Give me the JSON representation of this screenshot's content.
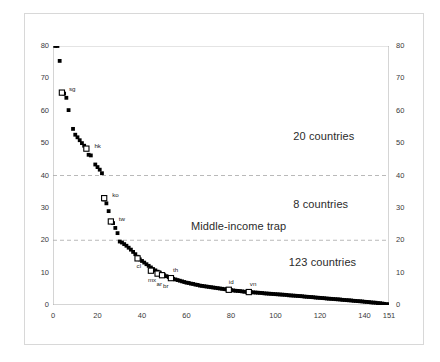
{
  "chart_data": {
    "type": "scatter",
    "title": "",
    "xlabel": "",
    "ylabel": "",
    "xlim": [
      0,
      151
    ],
    "ylim": [
      0,
      80
    ],
    "xticks": [
      0,
      20,
      40,
      60,
      80,
      100,
      120,
      140,
      151
    ],
    "yticks": [
      0,
      10,
      20,
      30,
      40,
      50,
      60,
      70,
      80
    ],
    "grid": "horizontal-dashed-at-20-and-40",
    "legend": "none",
    "left_axis_ticklabels": [
      "0",
      "10",
      "20",
      "30",
      "40",
      "50",
      "60",
      "70",
      "80"
    ],
    "right_axis_ticklabels": [
      "0",
      "10",
      "20",
      "30",
      "40",
      "50",
      "60",
      "70",
      "80"
    ],
    "x_axis_ticklabels": [
      "0",
      "20",
      "40",
      "60",
      "80",
      "100",
      "120",
      "140",
      "151"
    ],
    "annotations": [
      {
        "text": "20 countries",
        "x": 108,
        "y": 52
      },
      {
        "text": "8 countries",
        "x": 108,
        "y": 31
      },
      {
        "text": "Middle-income trap",
        "x": 62,
        "y": 24
      },
      {
        "text": "123 countries",
        "x": 106,
        "y": 13
      }
    ],
    "reference_lines": [
      {
        "y": 40,
        "style": "dashed",
        "color": "#b9b9b9"
      },
      {
        "y": 20,
        "style": "dashed",
        "color": "#b9b9b9"
      }
    ],
    "series": [
      {
        "name": "countries by income ratio (descending rank)",
        "marker": "filled-square",
        "points": [
          [
            1,
            80.0
          ],
          [
            2,
            80.0
          ],
          [
            3,
            75.4
          ],
          [
            5,
            65.3
          ],
          [
            6,
            64.0
          ],
          [
            7,
            60.2
          ],
          [
            9,
            54.4
          ],
          [
            10,
            52.6
          ],
          [
            11,
            51.8
          ],
          [
            12,
            50.9
          ],
          [
            13,
            50.0
          ],
          [
            14,
            49.2
          ],
          [
            16,
            46.4
          ],
          [
            17,
            46.2
          ],
          [
            19,
            43.4
          ],
          [
            20,
            42.6
          ],
          [
            21,
            41.8
          ],
          [
            22,
            40.7
          ],
          [
            23,
            32.6
          ],
          [
            24,
            31.4
          ],
          [
            25,
            29.0
          ],
          [
            27,
            25.3
          ],
          [
            28,
            23.8
          ],
          [
            29,
            22.2
          ],
          [
            30,
            19.6
          ],
          [
            31,
            19.3
          ],
          [
            32,
            18.8
          ],
          [
            33,
            18.3
          ],
          [
            34,
            17.7
          ],
          [
            35,
            17.1
          ],
          [
            36,
            16.4
          ],
          [
            37,
            15.7
          ],
          [
            38,
            14.9
          ],
          [
            39,
            14.1
          ],
          [
            40,
            13.6
          ],
          [
            41,
            13.1
          ],
          [
            42,
            12.6
          ],
          [
            43,
            12.1
          ],
          [
            44,
            11.6
          ],
          [
            45,
            11.1
          ],
          [
            46,
            10.7
          ],
          [
            47,
            10.3
          ],
          [
            48,
            10.0
          ],
          [
            49,
            9.6
          ],
          [
            50,
            9.2
          ],
          [
            51,
            8.9
          ],
          [
            52,
            8.6
          ],
          [
            53,
            8.3
          ],
          [
            54,
            8.1
          ],
          [
            55,
            7.9
          ],
          [
            56,
            7.7
          ],
          [
            57,
            7.5
          ],
          [
            58,
            7.3
          ],
          [
            59,
            7.1
          ],
          [
            60,
            6.9
          ],
          [
            61,
            6.8
          ],
          [
            62,
            6.6
          ],
          [
            63,
            6.5
          ],
          [
            64,
            6.3
          ],
          [
            65,
            6.2
          ],
          [
            66,
            6.0
          ],
          [
            67,
            5.9
          ],
          [
            68,
            5.8
          ],
          [
            69,
            5.7
          ],
          [
            70,
            5.6
          ],
          [
            71,
            5.5
          ],
          [
            72,
            5.4
          ],
          [
            73,
            5.3
          ],
          [
            74,
            5.2
          ],
          [
            75,
            5.1
          ],
          [
            76,
            5.0
          ],
          [
            77,
            4.9
          ],
          [
            78,
            4.8
          ],
          [
            79,
            4.7
          ],
          [
            80,
            4.6
          ],
          [
            81,
            4.5
          ],
          [
            82,
            4.4
          ],
          [
            83,
            4.35
          ],
          [
            84,
            4.3
          ],
          [
            85,
            4.2
          ],
          [
            86,
            4.1
          ],
          [
            87,
            4.05
          ],
          [
            88,
            4.0
          ],
          [
            89,
            3.95
          ],
          [
            90,
            3.9
          ],
          [
            91,
            3.85
          ],
          [
            92,
            3.8
          ],
          [
            93,
            3.75
          ],
          [
            94,
            3.7
          ],
          [
            95,
            3.6
          ],
          [
            96,
            3.55
          ],
          [
            97,
            3.5
          ],
          [
            98,
            3.45
          ],
          [
            99,
            3.4
          ],
          [
            100,
            3.35
          ],
          [
            101,
            3.3
          ],
          [
            102,
            3.25
          ],
          [
            103,
            3.2
          ],
          [
            104,
            3.15
          ],
          [
            105,
            3.1
          ],
          [
            106,
            3.0
          ],
          [
            107,
            2.95
          ],
          [
            108,
            2.9
          ],
          [
            109,
            2.85
          ],
          [
            110,
            2.8
          ],
          [
            111,
            2.75
          ],
          [
            112,
            2.7
          ],
          [
            113,
            2.6
          ],
          [
            114,
            2.55
          ],
          [
            115,
            2.5
          ],
          [
            116,
            2.45
          ],
          [
            117,
            2.4
          ],
          [
            118,
            2.3
          ],
          [
            119,
            2.25
          ],
          [
            120,
            2.2
          ],
          [
            121,
            2.15
          ],
          [
            122,
            2.1
          ],
          [
            123,
            2.0
          ],
          [
            124,
            1.95
          ],
          [
            125,
            1.9
          ],
          [
            126,
            1.85
          ],
          [
            127,
            1.8
          ],
          [
            128,
            1.75
          ],
          [
            129,
            1.7
          ],
          [
            130,
            1.6
          ],
          [
            131,
            1.55
          ],
          [
            132,
            1.5
          ],
          [
            133,
            1.45
          ],
          [
            134,
            1.4
          ],
          [
            135,
            1.3
          ],
          [
            136,
            1.25
          ],
          [
            137,
            1.2
          ],
          [
            138,
            1.15
          ],
          [
            139,
            1.1
          ],
          [
            140,
            1.0
          ],
          [
            141,
            0.95
          ],
          [
            142,
            0.9
          ],
          [
            143,
            0.8
          ],
          [
            144,
            0.75
          ],
          [
            145,
            0.7
          ],
          [
            146,
            0.6
          ],
          [
            147,
            0.55
          ],
          [
            148,
            0.45
          ],
          [
            149,
            0.35
          ],
          [
            150,
            0.25
          ],
          [
            151,
            0.2
          ]
        ]
      },
      {
        "name": "highlighted economies",
        "marker": "open-square",
        "points": [
          {
            "code": "sg",
            "x": 4,
            "y": 65.6,
            "label_dx": 7,
            "label_dy": -4
          },
          {
            "code": "hk",
            "x": 15,
            "y": 48.3,
            "label_dx": 8,
            "label_dy": -3
          },
          {
            "code": "ko",
            "x": 23,
            "y": 33.0,
            "label_dx": 8,
            "label_dy": -3
          },
          {
            "code": "tw",
            "x": 26,
            "y": 25.8,
            "label_dx": 8,
            "label_dy": -2
          },
          {
            "code": "cl",
            "x": 38,
            "y": 14.4,
            "label_dx": -1,
            "label_dy": 8
          },
          {
            "code": "mx",
            "x": 44,
            "y": 10.6,
            "label_dx": -3,
            "label_dy": 9
          },
          {
            "code": "ar",
            "x": 47,
            "y": 9.7,
            "label_dx": -1,
            "label_dy": 10
          },
          {
            "code": "br",
            "x": 49,
            "y": 9.2,
            "label_dx": 1,
            "label_dy": 11
          },
          {
            "code": "th",
            "x": 53,
            "y": 8.3,
            "label_dx": 2,
            "label_dy": -8
          },
          {
            "code": "id",
            "x": 79,
            "y": 4.7,
            "label_dx": 0,
            "label_dy": -8
          },
          {
            "code": "vn",
            "x": 88,
            "y": 4.0,
            "label_dx": 1,
            "label_dy": -8
          }
        ]
      }
    ]
  }
}
